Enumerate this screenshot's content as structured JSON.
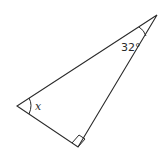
{
  "figure": {
    "type": "right-triangle",
    "vertices": {
      "top": {
        "x": 157,
        "y": 15
      },
      "left": {
        "x": 17,
        "y": 106
      },
      "bottom": {
        "x": 78,
        "y": 147
      }
    },
    "angles": {
      "top": {
        "label": "32°",
        "kind": "given"
      },
      "left": {
        "label": "x",
        "kind": "unknown"
      },
      "bottom": {
        "label": "",
        "kind": "right-angle"
      }
    }
  },
  "colors": {
    "stroke": "#2a2a2a",
    "background": "#ffffff"
  }
}
